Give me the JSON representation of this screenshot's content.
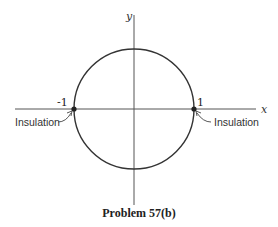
{
  "diagram": {
    "axes": {
      "x_label": "x",
      "y_label": "y"
    },
    "circle": {
      "description": "unit circle centered at origin",
      "radius": 1
    },
    "points": [
      {
        "label": "-1",
        "x": -1,
        "y": 0,
        "annotation": "Insulation"
      },
      {
        "label": "1",
        "x": 1,
        "y": 0,
        "annotation": "Insulation"
      }
    ],
    "caption": "Problem  57(b)"
  }
}
